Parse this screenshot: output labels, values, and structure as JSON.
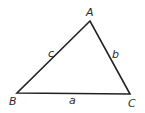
{
  "diagram": {
    "type": "triangle",
    "vertices": [
      {
        "name": "A",
        "label": "A"
      },
      {
        "name": "B",
        "label": "B"
      },
      {
        "name": "C",
        "label": "C"
      }
    ],
    "sides": [
      {
        "name": "a",
        "label": "a",
        "between": [
          "B",
          "C"
        ]
      },
      {
        "name": "b",
        "label": "b",
        "between": [
          "A",
          "C"
        ]
      },
      {
        "name": "c",
        "label": "c",
        "between": [
          "A",
          "B"
        ]
      }
    ],
    "stroke_color": "#222222"
  }
}
